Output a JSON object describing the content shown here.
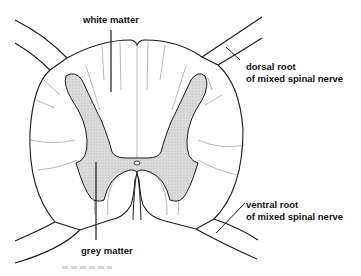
{
  "diagram": {
    "labels": {
      "white_matter": "white matter",
      "grey_matter": "grey matter",
      "dorsal_root_line1": "dorsal root",
      "dorsal_root_line2": "of mixed spinal nerve",
      "ventral_root_line1": "ventral root",
      "ventral_root_line2": "of mixed spinal nerve"
    },
    "colors": {
      "outline": "#1a1a1a",
      "grey_matter_fill": "#d9d9d9",
      "fiber_lines": "#9a9a9a",
      "background": "#ffffff"
    }
  }
}
